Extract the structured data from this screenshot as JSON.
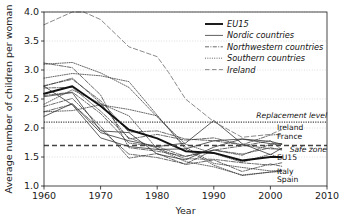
{
  "chart_data": {
    "type": "line",
    "title": "",
    "xlabel": "Year",
    "ylabel": "Average number of children per woman",
    "xlim": [
      1960,
      2010
    ],
    "ylim": [
      1.0,
      4.0
    ],
    "xticks": [
      1960,
      1970,
      1980,
      1990,
      2000,
      2010
    ],
    "yticks": [
      1.0,
      1.5,
      2.0,
      2.5,
      3.0,
      3.5,
      4.0
    ],
    "grid": true,
    "grid_axis": "y",
    "legend_position": "top-right",
    "reference_lines": [
      {
        "name": "Replacement level",
        "value": 2.1,
        "style": "dotted"
      },
      {
        "name": "Safe zone",
        "value": 1.7,
        "style": "dashed"
      }
    ],
    "series": [
      {
        "name": "EU15",
        "group": "EU15",
        "style": "solid-thick",
        "x": [
          1960,
          1965,
          1970,
          1975,
          1980,
          1985,
          1990,
          1995,
          2000,
          2002
        ],
        "values": [
          2.59,
          2.72,
          2.38,
          1.97,
          1.82,
          1.6,
          1.57,
          1.44,
          1.5,
          1.5
        ]
      },
      {
        "name": "Denmark",
        "group": "Nordic countries",
        "style": "solid",
        "x": [
          1960,
          1965,
          1970,
          1975,
          1980,
          1985,
          1990,
          1995,
          2000,
          2002
        ],
        "values": [
          2.54,
          2.61,
          1.95,
          1.92,
          1.55,
          1.45,
          1.67,
          1.81,
          1.77,
          1.72
        ]
      },
      {
        "name": "Finland",
        "group": "Nordic countries",
        "style": "solid",
        "x": [
          1960,
          1965,
          1970,
          1975,
          1980,
          1985,
          1990,
          1995,
          2000,
          2002
        ],
        "values": [
          2.72,
          2.4,
          1.83,
          1.68,
          1.63,
          1.64,
          1.78,
          1.81,
          1.73,
          1.72
        ]
      },
      {
        "name": "Sweden",
        "group": "Nordic countries",
        "style": "solid",
        "x": [
          1960,
          1965,
          1970,
          1975,
          1980,
          1985,
          1990,
          1995,
          2000,
          2002
        ],
        "values": [
          2.2,
          2.42,
          1.92,
          1.78,
          1.68,
          1.74,
          2.13,
          1.73,
          1.54,
          1.65
        ]
      },
      {
        "name": "Austria",
        "group": "Northwestern countries",
        "style": "dash-dot",
        "x": [
          1960,
          1965,
          1970,
          1975,
          1980,
          1985,
          1990,
          1995,
          2000,
          2002
        ],
        "values": [
          2.69,
          2.7,
          2.29,
          1.83,
          1.65,
          1.47,
          1.46,
          1.4,
          1.36,
          1.4
        ]
      },
      {
        "name": "Belgium",
        "group": "Northwestern countries",
        "style": "dash-dot",
        "x": [
          1960,
          1965,
          1970,
          1975,
          1980,
          1985,
          1990,
          1995,
          2000,
          2002
        ],
        "values": [
          2.56,
          2.62,
          2.25,
          1.74,
          1.68,
          1.51,
          1.62,
          1.55,
          1.66,
          1.62
        ]
      },
      {
        "name": "France",
        "group": "Northwestern countries",
        "style": "dash-dot",
        "x": [
          1960,
          1965,
          1970,
          1975,
          1980,
          1985,
          1990,
          1995,
          2000,
          2002
        ],
        "values": [
          2.73,
          2.84,
          2.47,
          1.93,
          1.95,
          1.81,
          1.78,
          1.71,
          1.88,
          1.89
        ]
      },
      {
        "name": "Germany",
        "group": "Northwestern countries",
        "style": "dash-dot",
        "x": [
          1960,
          1965,
          1970,
          1975,
          1980,
          1985,
          1990,
          1995,
          2000,
          2002
        ],
        "values": [
          2.37,
          2.51,
          2.03,
          1.48,
          1.56,
          1.37,
          1.45,
          1.25,
          1.38,
          1.34
        ]
      },
      {
        "name": "Luxembourg",
        "group": "Northwestern countries",
        "style": "dash-dot",
        "x": [
          1960,
          1965,
          1970,
          1975,
          1980,
          1985,
          1990,
          1995,
          2000,
          2002
        ],
        "values": [
          2.28,
          2.41,
          1.98,
          1.55,
          1.49,
          1.38,
          1.62,
          1.69,
          1.78,
          1.63
        ]
      },
      {
        "name": "Netherlands",
        "group": "Northwestern countries",
        "style": "dash-dot",
        "x": [
          1960,
          1965,
          1970,
          1975,
          1980,
          1985,
          1990,
          1995,
          2000,
          2002
        ],
        "values": [
          3.12,
          3.04,
          2.57,
          1.66,
          1.6,
          1.51,
          1.62,
          1.53,
          1.72,
          1.73
        ]
      },
      {
        "name": "United Kingdom",
        "group": "Northwestern countries",
        "style": "dash-dot",
        "x": [
          1960,
          1965,
          1970,
          1975,
          1980,
          1985,
          1990,
          1995,
          2000,
          2002
        ],
        "values": [
          2.72,
          2.86,
          2.43,
          1.81,
          1.89,
          1.79,
          1.83,
          1.71,
          1.64,
          1.64
        ]
      },
      {
        "name": "Greece",
        "group": "Southern countries",
        "style": "dotted",
        "x": [
          1960,
          1965,
          1970,
          1975,
          1980,
          1985,
          1990,
          1995,
          2000,
          2002
        ],
        "values": [
          2.28,
          2.3,
          2.4,
          2.32,
          2.21,
          1.67,
          1.39,
          1.32,
          1.26,
          1.27
        ]
      },
      {
        "name": "Italy",
        "group": "Southern countries",
        "style": "dotted",
        "x": [
          1960,
          1965,
          1970,
          1975,
          1980,
          1985,
          1990,
          1995,
          2000,
          2002
        ],
        "values": [
          2.41,
          2.66,
          2.42,
          2.21,
          1.64,
          1.42,
          1.33,
          1.19,
          1.24,
          1.26
        ]
      },
      {
        "name": "Portugal",
        "group": "Southern countries",
        "style": "dotted",
        "x": [
          1960,
          1965,
          1970,
          1975,
          1980,
          1985,
          1990,
          1995,
          2000,
          2002
        ],
        "values": [
          3.1,
          3.13,
          2.95,
          2.7,
          2.19,
          1.72,
          1.56,
          1.41,
          1.55,
          1.47
        ]
      },
      {
        "name": "Spain",
        "group": "Southern countries",
        "style": "dotted",
        "x": [
          1960,
          1965,
          1970,
          1975,
          1980,
          1985,
          1990,
          1995,
          2000,
          2002
        ],
        "values": [
          2.86,
          2.94,
          2.9,
          2.8,
          2.22,
          1.64,
          1.36,
          1.18,
          1.24,
          1.25
        ]
      },
      {
        "name": "Ireland",
        "group": "Ireland",
        "style": "long-dash",
        "x": [
          1960,
          1965,
          1967,
          1970,
          1975,
          1980,
          1982,
          1985,
          1990,
          1995,
          2000,
          2002
        ],
        "values": [
          3.78,
          4.0,
          4.0,
          3.87,
          3.4,
          3.23,
          2.96,
          2.5,
          2.11,
          1.84,
          1.89,
          1.97
        ]
      }
    ],
    "legend": [
      {
        "label": "EU15",
        "style": "solid-thick"
      },
      {
        "label": "Nordic countries",
        "style": "solid"
      },
      {
        "label": "Northwestern countries",
        "style": "dash-dot"
      },
      {
        "label": "Southern countries",
        "style": "dotted"
      },
      {
        "label": "Ireland",
        "style": "long-dash"
      }
    ],
    "annotations": [
      {
        "label": "Replacement level",
        "value": 2.1,
        "italic": true
      },
      {
        "label": "Ireland",
        "value": 1.97,
        "italic": false
      },
      {
        "label": "France",
        "value": 1.89,
        "italic": false
      },
      {
        "label": "Safe zone",
        "value": 1.7,
        "italic": true
      },
      {
        "label": "EU15",
        "value": 1.5,
        "italic": false
      },
      {
        "label": "Italy",
        "value": 1.26,
        "italic": false
      },
      {
        "label": "Spain",
        "value": 1.25,
        "italic": false
      }
    ],
    "colors": {
      "axis": "#1a1a1a",
      "grid": "#c8c8c8",
      "series_dark": "#1a1a1a",
      "series_mid": "#555555",
      "series_light": "#8a8a8a"
    }
  }
}
